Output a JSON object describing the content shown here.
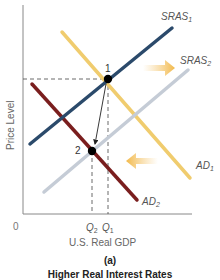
{
  "diagram": {
    "axes": {
      "y_label": "Price Level",
      "x_label": "U.S. Real GDP",
      "origin": "0",
      "axis_color": "#888888"
    },
    "curves": [
      {
        "id": "SRAS1",
        "label": "SRAS",
        "sub": "1",
        "color": "#2b4a6b"
      },
      {
        "id": "SRAS2",
        "label": "SRAS",
        "sub": "2",
        "color": "#c5ccd6"
      },
      {
        "id": "AD1",
        "label": "AD",
        "sub": "1",
        "color": "#f0cc6e"
      },
      {
        "id": "AD2",
        "label": "AD",
        "sub": "2",
        "color": "#7a1e1e"
      }
    ],
    "points": [
      {
        "id": "1",
        "label": "1"
      },
      {
        "id": "2",
        "label": "2"
      }
    ],
    "ticks": [
      {
        "label": "Q",
        "sub": "2"
      },
      {
        "label": "Q",
        "sub": "1"
      }
    ],
    "shift_arrows": [
      {
        "direction": "right",
        "applies_to": "SRAS",
        "color": "#f5c978"
      },
      {
        "direction": "left",
        "applies_to": "AD",
        "color": "#f5c978"
      }
    ],
    "panel": "(a)",
    "caption": "Higher Real Interest Rates"
  }
}
